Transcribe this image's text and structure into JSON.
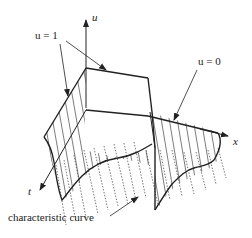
{
  "figure": {
    "type": "3d-surface-diagram",
    "axes": {
      "u": "u",
      "x": "x",
      "t": "t"
    },
    "annotations": {
      "u_equals_1": "u = 1",
      "u_equals_0": "u = 0",
      "characteristic_curve": "characteristic curve"
    },
    "colors": {
      "line": "#222222",
      "hatch": "#444444",
      "dotted": "#555555",
      "background": "#ffffff"
    }
  }
}
